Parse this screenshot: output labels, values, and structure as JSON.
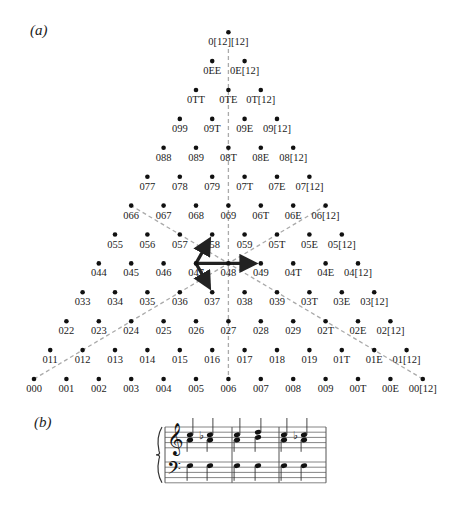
{
  "panels": {
    "a": {
      "label": "(a)"
    },
    "b": {
      "label": "(b)"
    }
  },
  "lattice": {
    "origin_x": 34,
    "origin_y": 379,
    "col_spacing": 32.4,
    "row_spacing": 28.9,
    "rows": [
      [
        "000",
        "001",
        "002",
        "003",
        "004",
        "005",
        "006",
        "007",
        "008",
        "009",
        "00T",
        "00E",
        "00[12]"
      ],
      [
        "011",
        "012",
        "013",
        "014",
        "015",
        "016",
        "017",
        "018",
        "019",
        "01T",
        "01E",
        "01[12]"
      ],
      [
        "022",
        "023",
        "024",
        "025",
        "026",
        "027",
        "028",
        "029",
        "02T",
        "02E",
        "02[12]"
      ],
      [
        "033",
        "034",
        "035",
        "036",
        "037",
        "038",
        "039",
        "03T",
        "03E",
        "03[12]"
      ],
      [
        "044",
        "045",
        "046",
        "047",
        "048",
        "049",
        "04T",
        "04E",
        "04[12]"
      ],
      [
        "055",
        "056",
        "057",
        "058",
        "059",
        "05T",
        "05E",
        "05[12]"
      ],
      [
        "066",
        "067",
        "068",
        "069",
        "06T",
        "06E",
        "06[12]"
      ],
      [
        "077",
        "078",
        "079",
        "07T",
        "07E",
        "07[12]"
      ],
      [
        "088",
        "089",
        "08T",
        "08E",
        "08[12]"
      ],
      [
        "099",
        "09T",
        "09E",
        "09[12]"
      ],
      [
        "0TT",
        "0TE",
        "0T[12]"
      ],
      [
        "0EE",
        "0E[12]"
      ],
      [
        "0[12][12]"
      ]
    ],
    "dashed_lines": [
      {
        "from": [
          6,
          0
        ],
        "to": [
          0,
          12
        ],
        "note": "vertical axis col6 row0 to apex"
      },
      {
        "from": [
          0,
          0
        ],
        "to": [
          6,
          6
        ],
        "note": "000 to 06[12]"
      },
      {
        "from": [
          12,
          0
        ],
        "to": [
          0,
          6
        ],
        "note": "00[12] to 066"
      }
    ],
    "arrows": [
      {
        "from": "047",
        "to": "058"
      },
      {
        "from": "047",
        "to": "049"
      },
      {
        "from": "047",
        "to": "037"
      }
    ]
  },
  "music": {
    "measures": 3,
    "treble_chords": [
      {
        "notes": [
          "A4",
          "C5"
        ],
        "accidental": ""
      },
      {
        "notes": [
          "A4",
          "C5"
        ],
        "accidental": "flat"
      },
      {
        "notes": [
          "A4",
          "C5"
        ],
        "accidental": ""
      },
      {
        "notes": [
          "B4",
          "D5"
        ],
        "accidental": ""
      },
      {
        "notes": [
          "A4",
          "C5"
        ],
        "accidental": ""
      },
      {
        "notes": [
          "A4",
          "C5"
        ],
        "accidental": "flat"
      }
    ],
    "bass_notes": [
      "D3",
      "D3",
      "D3",
      "D3",
      "D3",
      "D3"
    ]
  }
}
